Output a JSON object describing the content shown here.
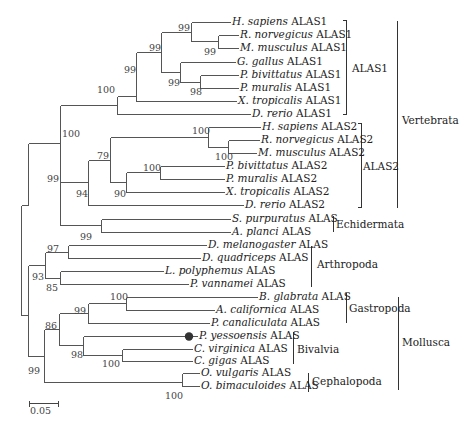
{
  "figure": {
    "type": "phylogenetic_tree",
    "scale_bar": {
      "label": "0.05",
      "x1": 29,
      "x2": 58,
      "y": 403
    }
  },
  "taxa": [
    {
      "genus": "H. sapiens",
      "gene": "ALAS1",
      "x": 232,
      "y": 22
    },
    {
      "genus": "R. norvegicus",
      "gene": "ALAS1",
      "x": 240,
      "y": 35
    },
    {
      "genus": "M. musculus",
      "gene": "ALAS1",
      "x": 240,
      "y": 48
    },
    {
      "genus": "G. gallus",
      "gene": "ALAS1",
      "x": 237,
      "y": 62
    },
    {
      "genus": "P. bivittatus",
      "gene": "ALAS1",
      "x": 240,
      "y": 75
    },
    {
      "genus": "P. muralis",
      "gene": "ALAS1",
      "x": 240,
      "y": 88
    },
    {
      "genus": "X. tropicalis",
      "gene": "ALAS1",
      "x": 238,
      "y": 101
    },
    {
      "genus": "D. rerio",
      "gene": "ALAS1",
      "x": 252,
      "y": 114
    },
    {
      "genus": "H. sapiens",
      "gene": "ALAS2",
      "x": 262,
      "y": 127
    },
    {
      "genus": "R. norvegicus",
      "gene": "ALAS2",
      "x": 261,
      "y": 140
    },
    {
      "genus": "M. musculus",
      "gene": "ALAS2",
      "x": 258,
      "y": 153
    },
    {
      "genus": "P. bivittatus",
      "gene": "ALAS2",
      "x": 226,
      "y": 166
    },
    {
      "genus": "P. muralis",
      "gene": "ALAS2",
      "x": 226,
      "y": 179
    },
    {
      "genus": "X. tropicalis",
      "gene": "ALAS2",
      "x": 226,
      "y": 192
    },
    {
      "genus": "D. rerio",
      "gene": "ALAS2",
      "x": 245,
      "y": 205
    },
    {
      "genus": "S. purpuratus",
      "gene": "ALAS",
      "x": 232,
      "y": 219
    },
    {
      "genus": "A. planci",
      "gene": "ALAS",
      "x": 232,
      "y": 232
    },
    {
      "genus": "D. melanogaster",
      "gene": "ALAS",
      "x": 208,
      "y": 245
    },
    {
      "genus": "D. quadriceps",
      "gene": "ALAS",
      "x": 202,
      "y": 258
    },
    {
      "genus": "L. polyphemus",
      "gene": "ALAS",
      "x": 165,
      "y": 271
    },
    {
      "genus": "P. vannamei",
      "gene": "ALAS",
      "x": 190,
      "y": 284
    },
    {
      "genus": "B. glabrata",
      "gene": "ALAS",
      "x": 259,
      "y": 297
    },
    {
      "genus": "A. californica",
      "gene": "ALAS",
      "x": 216,
      "y": 310
    },
    {
      "genus": "P. canaliculata",
      "gene": "ALAS",
      "x": 211,
      "y": 323
    },
    {
      "genus": "P. yessoensis",
      "gene": "ALAS",
      "x": 199,
      "y": 336,
      "marker": "filled-circle"
    },
    {
      "genus": "C. virginica",
      "gene": "ALAS",
      "x": 194,
      "y": 349
    },
    {
      "genus": "C. gigas",
      "gene": "ALAS",
      "x": 194,
      "y": 361
    },
    {
      "genus": "O. vulgaris",
      "gene": "ALAS",
      "x": 201,
      "y": 373
    },
    {
      "genus": "O. bimaculoides",
      "gene": "ALAS",
      "x": 201,
      "y": 386
    }
  ],
  "branches": [
    [
      191,
      22,
      230,
      22
    ],
    [
      218,
      41,
      227,
      41
    ],
    [
      218,
      35,
      238,
      35
    ],
    [
      218,
      48,
      238,
      48
    ],
    [
      191,
      22,
      191,
      41
    ],
    [
      191,
      41,
      218,
      41
    ],
    [
      180,
      62,
      235,
      62
    ],
    [
      200,
      82,
      238,
      82
    ],
    [
      200,
      75,
      238,
      75
    ],
    [
      200,
      88,
      238,
      88
    ],
    [
      200,
      75,
      200,
      88
    ],
    [
      180,
      62,
      180,
      82
    ],
    [
      180,
      82,
      200,
      82
    ],
    [
      161,
      32,
      191,
      32
    ],
    [
      161,
      72,
      180,
      72
    ],
    [
      161,
      32,
      161,
      72
    ],
    [
      136,
      52,
      161,
      52
    ],
    [
      136,
      101,
      236,
      101
    ],
    [
      136,
      52,
      136,
      101
    ],
    [
      117,
      96,
      136,
      96
    ],
    [
      117,
      114,
      250,
      114
    ],
    [
      117,
      96,
      117,
      114
    ],
    [
      208,
      127,
      260,
      127
    ],
    [
      208,
      147,
      228,
      147
    ],
    [
      228,
      140,
      259,
      140
    ],
    [
      228,
      153,
      256,
      153
    ],
    [
      228,
      140,
      228,
      153
    ],
    [
      208,
      127,
      208,
      147
    ],
    [
      160,
      170,
      208,
      170
    ],
    [
      160,
      166,
      224,
      166
    ],
    [
      160,
      179,
      224,
      179
    ],
    [
      160,
      166,
      160,
      179
    ],
    [
      126,
      178,
      160,
      178
    ],
    [
      126,
      192,
      224,
      192
    ],
    [
      126,
      178,
      126,
      192
    ],
    [
      110,
      137,
      208,
      137
    ],
    [
      110,
      185,
      126,
      185
    ],
    [
      110,
      137,
      110,
      185
    ],
    [
      88,
      161,
      110,
      161
    ],
    [
      88,
      205,
      243,
      205
    ],
    [
      88,
      161,
      88,
      205
    ],
    [
      60,
      136,
      88,
      136
    ],
    [
      60,
      108,
      117,
      108
    ],
    [
      60,
      183,
      88,
      183
    ],
    [
      60,
      108,
      60,
      183
    ],
    [
      101,
      226,
      101,
      226
    ],
    [
      101,
      219,
      230,
      219
    ],
    [
      101,
      232,
      230,
      232
    ],
    [
      101,
      219,
      101,
      232
    ],
    [
      60,
      226,
      101,
      226
    ],
    [
      28,
      165,
      60,
      165
    ],
    [
      28,
      165,
      28,
      303
    ],
    [
      68,
      252,
      68,
      252
    ],
    [
      68,
      245,
      196,
      245
    ],
    [
      68,
      258,
      196,
      258
    ],
    [
      68,
      245,
      68,
      258
    ],
    [
      60,
      252,
      68,
      252
    ],
    [
      60,
      271,
      60,
      282
    ],
    [
      60,
      277,
      163,
      271
    ],
    [
      45,
      264,
      45,
      264
    ]
  ],
  "support_values": [
    {
      "value": "99",
      "x": 178,
      "y": 23
    },
    {
      "value": "99",
      "x": 204,
      "y": 47
    },
    {
      "value": "99",
      "x": 149,
      "y": 43
    },
    {
      "value": "99",
      "x": 168,
      "y": 78
    },
    {
      "value": "98",
      "x": 190,
      "y": 87
    },
    {
      "value": "99",
      "x": 124,
      "y": 65
    },
    {
      "value": "100",
      "x": 97,
      "y": 85
    },
    {
      "value": "100",
      "x": 192,
      "y": 126
    },
    {
      "value": "100",
      "x": 215,
      "y": 152
    },
    {
      "value": "79",
      "x": 97,
      "y": 151
    },
    {
      "value": "100",
      "x": 143,
      "y": 163
    },
    {
      "value": "90",
      "x": 114,
      "y": 189
    },
    {
      "value": "94",
      "x": 76,
      "y": 189
    },
    {
      "value": "100",
      "x": 62,
      "y": 129
    },
    {
      "value": "99",
      "x": 47,
      "y": 174
    },
    {
      "value": "99",
      "x": 80,
      "y": 232
    },
    {
      "value": "97",
      "x": 47,
      "y": 244
    },
    {
      "value": "93",
      "x": 32,
      "y": 272
    },
    {
      "value": "85",
      "x": 46,
      "y": 283
    },
    {
      "value": "100",
      "x": 110,
      "y": 292
    },
    {
      "value": "99",
      "x": 74,
      "y": 306
    },
    {
      "value": "86",
      "x": 45,
      "y": 321
    },
    {
      "value": "98",
      "x": 71,
      "y": 350
    },
    {
      "value": "100",
      "x": 102,
      "y": 359
    },
    {
      "value": "99",
      "x": 28,
      "y": 366
    },
    {
      "value": "100",
      "x": 165,
      "y": 391
    }
  ],
  "group_brackets": [
    {
      "label": "ALAS1",
      "x": 346,
      "y1": 20,
      "y2": 114,
      "label_x": 352,
      "label_y": 62,
      "style": "bracket"
    },
    {
      "label": "ALAS2",
      "x": 361,
      "y1": 123,
      "y2": 207,
      "label_x": 363,
      "label_y": 160,
      "style": "bracket"
    },
    {
      "label": "Vertebrata",
      "x": 397,
      "y1": 20,
      "y2": 207,
      "label_x": 402,
      "label_y": 114,
      "style": "line"
    },
    {
      "label": "Echidermata",
      "x": 333,
      "y1": 215,
      "y2": 231,
      "label_x": 336,
      "label_y": 218,
      "style": "line"
    },
    {
      "label": "Arthropoda",
      "x": 311,
      "y1": 245,
      "y2": 286,
      "label_x": 317,
      "label_y": 258,
      "style": "line"
    },
    {
      "label": "Gastropoda",
      "x": 346,
      "y1": 292,
      "y2": 322,
      "label_x": 349,
      "label_y": 302,
      "style": "line"
    },
    {
      "label": "Bivalvia",
      "x": 293,
      "y1": 331,
      "y2": 363,
      "label_x": 297,
      "label_y": 343,
      "style": "line"
    },
    {
      "label": "Cephalopoda",
      "x": 308,
      "y1": 372,
      "y2": 391,
      "label_x": 312,
      "label_y": 375,
      "style": "line"
    },
    {
      "label": "Mollusca",
      "x": 398,
      "y1": 296,
      "y2": 389,
      "label_x": 402,
      "label_y": 336,
      "style": "line"
    }
  ]
}
